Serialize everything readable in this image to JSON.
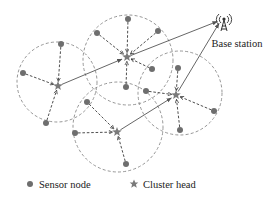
{
  "diagram": {
    "base_station": {
      "label": "Base station",
      "icon": "antenna-tower-icon",
      "x": 224,
      "y": 22
    },
    "legend": {
      "sensor_node_label": "Sensor node",
      "cluster_head_label": "Cluster head"
    },
    "colors": {
      "node": "#6e6e6e",
      "cluster_head": "#7a7a7a",
      "ring": "#8a8a8a",
      "link": "#3a3a3a"
    },
    "clusters": [
      {
        "id": "left",
        "ring": {
          "cx": 57,
          "cy": 82,
          "r": 40
        },
        "head": {
          "x": 58,
          "y": 86
        },
        "nodes": [
          {
            "x": 61,
            "y": 44
          },
          {
            "x": 23,
            "y": 73
          },
          {
            "x": 46,
            "y": 123
          }
        ]
      },
      {
        "id": "top",
        "ring": {
          "cx": 128,
          "cy": 60,
          "r": 45
        },
        "head": {
          "x": 127,
          "y": 57
        },
        "nodes": [
          {
            "x": 128,
            "y": 19
          },
          {
            "x": 97,
            "y": 33
          },
          {
            "x": 158,
            "y": 31
          },
          {
            "x": 152,
            "y": 69
          },
          {
            "x": 126,
            "y": 87
          }
        ]
      },
      {
        "id": "right",
        "ring": {
          "cx": 180,
          "cy": 93,
          "r": 42
        },
        "head": {
          "x": 176,
          "y": 95
        },
        "nodes": [
          {
            "x": 178,
            "y": 68
          },
          {
            "x": 146,
            "y": 91
          },
          {
            "x": 214,
            "y": 111
          },
          {
            "x": 180,
            "y": 130
          }
        ]
      },
      {
        "id": "bottom",
        "ring": {
          "cx": 118,
          "cy": 127,
          "r": 45
        },
        "head": {
          "x": 117,
          "y": 132
        },
        "nodes": [
          {
            "x": 87,
            "y": 102
          },
          {
            "x": 75,
            "y": 133
          },
          {
            "x": 126,
            "y": 164
          }
        ]
      }
    ],
    "inter_cluster_links": [
      {
        "from": "left",
        "to": "top"
      },
      {
        "from": "top",
        "to": "base_station"
      },
      {
        "from": "bottom",
        "to": "right"
      },
      {
        "from": "right",
        "to": "base_station"
      }
    ]
  }
}
